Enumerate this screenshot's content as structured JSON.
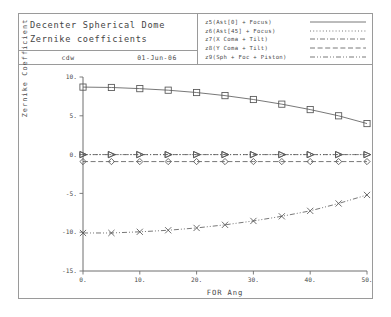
{
  "titleblock": {
    "line1": "Decenter Spherical Dome",
    "line2": "Zernike coefficients",
    "author": "cdw",
    "date": "01-Jun-06"
  },
  "legend": {
    "entries": [
      {
        "label": "z5(Ast[0] + Focus)",
        "style": "solid",
        "marker": "square"
      },
      {
        "label": "z6(Ast[45] + Focus)",
        "style": "dotted",
        "marker": "triangle"
      },
      {
        "label": "z7(X Coma + Tilt)",
        "style": "dashdot",
        "marker": "triangle"
      },
      {
        "label": "z8(Y Coma + Tilt)",
        "style": "dashed",
        "marker": "diamond"
      },
      {
        "label": "z9(Sph + Foc + Piston)",
        "style": "dashdotdot",
        "marker": "cross"
      }
    ]
  },
  "chart_data": {
    "type": "line",
    "title": "Decenter Spherical Dome Zernike coefficients",
    "xlabel": "FOR Ang",
    "ylabel": "Zernike Coefficient",
    "x": [
      0,
      5,
      10,
      15,
      20,
      25,
      30,
      35,
      40,
      45,
      50
    ],
    "xlim": [
      0,
      50
    ],
    "ylim": [
      -15,
      10
    ],
    "xticks": [
      "0.",
      "10.",
      "20.",
      "30.",
      "40.",
      "50."
    ],
    "xtick_values": [
      0,
      10,
      20,
      30,
      40,
      50
    ],
    "yticks": [
      "10.",
      "5.",
      "0.",
      "-5.",
      "-10.",
      "-15."
    ],
    "ytick_values": [
      10,
      5,
      0,
      -5,
      -10,
      -15
    ],
    "grid": false,
    "legend_position": "top-right",
    "series": [
      {
        "name": "z5(Ast[0] + Focus)",
        "marker": "square",
        "style": "solid",
        "values": [
          8.7,
          8.65,
          8.5,
          8.3,
          8.0,
          7.6,
          7.1,
          6.5,
          5.8,
          5.0,
          4.0
        ]
      },
      {
        "name": "z6(Ast[45] + Focus)",
        "marker": "triangle",
        "style": "dotted",
        "values": [
          0.0,
          0.0,
          0.0,
          0.0,
          0.0,
          0.0,
          0.0,
          0.0,
          0.0,
          0.0,
          0.0
        ]
      },
      {
        "name": "z7(X Coma + Tilt)",
        "marker": "triangle",
        "style": "dashdot",
        "values": [
          0.0,
          0.0,
          0.0,
          0.0,
          0.0,
          0.0,
          0.0,
          0.0,
          0.0,
          0.0,
          0.0
        ]
      },
      {
        "name": "z8(Y Coma + Tilt)",
        "marker": "diamond",
        "style": "dashed",
        "values": [
          -0.9,
          -0.9,
          -0.9,
          -0.9,
          -0.9,
          -0.9,
          -0.9,
          -0.9,
          -0.9,
          -0.9,
          -0.9
        ]
      },
      {
        "name": "z9(Sph + Foc + Piston)",
        "marker": "cross",
        "style": "dashdotdot",
        "values": [
          -10.1,
          -10.1,
          -9.95,
          -9.75,
          -9.45,
          -9.05,
          -8.55,
          -7.95,
          -7.25,
          -6.3,
          -5.2
        ]
      }
    ]
  }
}
